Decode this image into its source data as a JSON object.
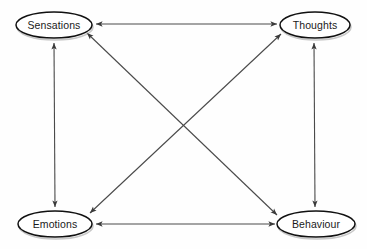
{
  "diagram": {
    "background_color": "#fefefe",
    "line_color": "#4a4a4a",
    "node_stroke_color": "#111111",
    "node_fill_color": "#ffffff",
    "text_color": "#1a1a1a",
    "nodes": [
      {
        "id": "sensations",
        "label": "Sensations",
        "cx": 54,
        "cy": 25,
        "rx": 38,
        "ry": 13
      },
      {
        "id": "thoughts",
        "label": "Thoughts",
        "cx": 315,
        "cy": 25,
        "rx": 35,
        "ry": 13
      },
      {
        "id": "emotions",
        "label": "Emotions",
        "cx": 55,
        "cy": 224,
        "rx": 37,
        "ry": 13
      },
      {
        "id": "behaviour",
        "label": "Behaviour",
        "cx": 316,
        "cy": 224,
        "rx": 39,
        "ry": 13
      }
    ],
    "connections": [
      {
        "id": "sensations-thoughts",
        "from": "sensations",
        "to": "thoughts",
        "style": "double-arrow",
        "orientation": "horizontal-top"
      },
      {
        "id": "emotions-behaviour",
        "from": "emotions",
        "to": "behaviour",
        "style": "double-arrow",
        "orientation": "horizontal-bottom"
      },
      {
        "id": "sensations-emotions",
        "from": "sensations",
        "to": "emotions",
        "style": "double-arrow",
        "orientation": "vertical-left"
      },
      {
        "id": "thoughts-behaviour",
        "from": "thoughts",
        "to": "behaviour",
        "style": "double-arrow",
        "orientation": "vertical-right"
      },
      {
        "id": "sensations-behaviour",
        "from": "sensations",
        "to": "behaviour",
        "style": "double-arrow",
        "orientation": "diagonal-down-right"
      },
      {
        "id": "thoughts-emotions",
        "from": "thoughts",
        "to": "emotions",
        "style": "double-arrow",
        "orientation": "diagonal-down-left"
      }
    ]
  }
}
